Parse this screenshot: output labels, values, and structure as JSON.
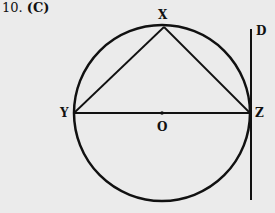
{
  "question": {
    "number": "10.",
    "answer": "(C)"
  },
  "diagram": {
    "labels": {
      "X": "X",
      "Y": "Y",
      "Z": "Z",
      "O": "O",
      "D": "D"
    },
    "circle": {
      "cx": 162,
      "cy": 113,
      "r": 88
    },
    "points": {
      "X": [
        164,
        26
      ],
      "Y": [
        74,
        113
      ],
      "Z": [
        250,
        113
      ],
      "O": [
        162,
        113
      ]
    },
    "tangent_line": {
      "x": 250,
      "y1": 29,
      "y2": 200
    },
    "stroke_color": "#111111",
    "background": "#ebebeb"
  }
}
